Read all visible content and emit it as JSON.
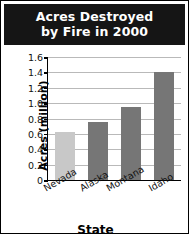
{
  "chart_data": {
    "type": "bar",
    "title": "Acres Destroyed by Fire in 2000",
    "title_lines": [
      "Acres Destroyed",
      "by Fire in 2000"
    ],
    "categories": [
      "Nevada",
      "Alaska",
      "Montana",
      "Idaho"
    ],
    "values": [
      0.63,
      0.75,
      0.95,
      1.4
    ],
    "xlabel": "State",
    "ylabel": "Acres (million)",
    "ylim": [
      0,
      1.6
    ],
    "ytick_step": 0.2,
    "ytick_labels": [
      "1.6",
      "1.4",
      "1.2",
      "1.0",
      "0.8",
      "0.6",
      "0.4",
      "0.2",
      "0"
    ],
    "ytick_values": [
      1.6,
      1.4,
      1.2,
      1.0,
      0.8,
      0.6,
      0.4,
      0.2,
      0
    ],
    "grid": true,
    "legend": false,
    "bar_colors": [
      "#c8c8c8",
      "#767676",
      "#767676",
      "#767676"
    ],
    "colors": {
      "title_background": "#151515",
      "title_text": "#ffffff",
      "gridline": "#b9b9b9",
      "axis": "#000000",
      "bar_light": "#c8c8c8",
      "bar_dark": "#767676",
      "card_background": "#ffffff",
      "card_border": "#000000"
    }
  }
}
